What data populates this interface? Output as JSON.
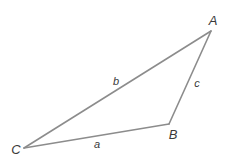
{
  "diagram": {
    "type": "triangle",
    "stroke_color": "#8c8c8c",
    "label_color": "#3a3a3a",
    "vertices": {
      "A": {
        "label": "A",
        "x": 211,
        "y": 31,
        "label_x": 213,
        "label_y": 20
      },
      "B": {
        "label": "B",
        "x": 169,
        "y": 124,
        "label_x": 173,
        "label_y": 134
      },
      "C": {
        "label": "C",
        "x": 24,
        "y": 148,
        "label_x": 16,
        "label_y": 149
      }
    },
    "sides": {
      "a": {
        "label": "a",
        "from": "B",
        "to": "C",
        "label_x": 97,
        "label_y": 144
      },
      "b": {
        "label": "b",
        "from": "C",
        "to": "A",
        "label_x": 116,
        "label_y": 81
      },
      "c": {
        "label": "c",
        "from": "A",
        "to": "B",
        "label_x": 197,
        "label_y": 83
      }
    }
  }
}
